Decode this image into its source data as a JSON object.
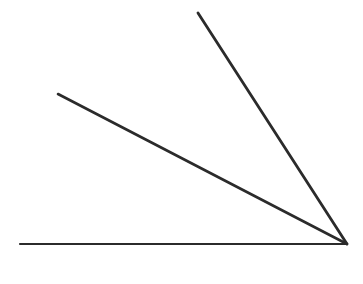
{
  "figure": {
    "background_color": "#ffffff",
    "stroke_color": "#2b2b2b",
    "canvas": {
      "width": 363,
      "height": 284
    },
    "vertex": {
      "label": "vertex",
      "x": 347,
      "y": 244
    },
    "rays": [
      {
        "name": "horizontal-ray",
        "label": "Horizontal base ray",
        "x1": 347,
        "y1": 244,
        "x2": 20,
        "y2": 244,
        "stroke_width": 2.2,
        "angle_deg": 180
      },
      {
        "name": "middle-ray",
        "label": "Middle ray",
        "x1": 347,
        "y1": 244,
        "x2": 58,
        "y2": 94,
        "stroke_width": 2.6,
        "angle_deg": 152.6
      },
      {
        "name": "upper-ray",
        "label": "Upper ray",
        "x1": 347,
        "y1": 244,
        "x2": 198,
        "y2": 13,
        "stroke_width": 2.8,
        "angle_deg": 122.8
      }
    ],
    "angles": [
      {
        "name": "angle-horizontal-middle",
        "between": [
          "horizontal-ray",
          "middle-ray"
        ],
        "value_deg": 27.4
      },
      {
        "name": "angle-middle-upper",
        "between": [
          "middle-ray",
          "upper-ray"
        ],
        "value_deg": 29.8
      },
      {
        "name": "angle-horizontal-upper",
        "between": [
          "horizontal-ray",
          "upper-ray"
        ],
        "value_deg": 57.2
      }
    ]
  }
}
